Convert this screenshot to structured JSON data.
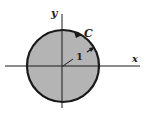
{
  "diagram": {
    "labels": {
      "x_axis": "x",
      "y_axis": "y",
      "curve": "C",
      "radius": "1"
    },
    "colors": {
      "disk_fill": "#b4b4b4",
      "stroke": "#1a1a1a"
    }
  }
}
